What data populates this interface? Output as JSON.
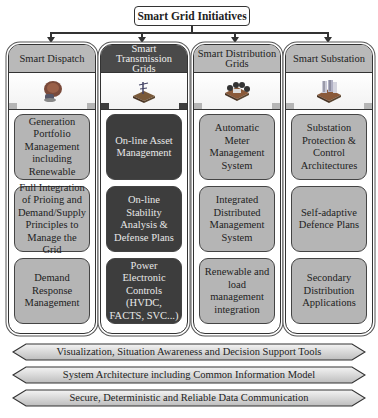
{
  "title": "Smart Grid Initiatives",
  "colors": {
    "light_fill": "#b5b5b5",
    "dark_fill": "#3d3d3d",
    "header_light": "#b9b9b9",
    "header_dark": "#4a4a4a",
    "stroke": "#333333"
  },
  "columns": [
    {
      "title": "Smart Dispatch",
      "icon": "generator-icon",
      "style": "light",
      "items": [
        "Generation Portfolio Management including Renewable",
        "Full Integration of Prioing and Demand/Supply Principles to Manage the Grid",
        "Demand Response Management"
      ]
    },
    {
      "title": "Smart Transmission Grids",
      "icon": "transmission-tower-icon",
      "style": "dark",
      "items": [
        "On-line Asset Management",
        "On-line Stability Analysis & Defense Plans",
        "Power Electronic Controls (HVDC, FACTS, SVC...)"
      ]
    },
    {
      "title": "Smart Distribution Grids",
      "icon": "distribution-network-icon",
      "style": "light",
      "items": [
        "Automatic Meter Management System",
        "Integrated Distributed Management System",
        "Renewable and load management integration"
      ]
    },
    {
      "title": "Smart Substation",
      "icon": "substation-icon",
      "style": "light",
      "items": [
        "Substation Protection & Control Architectures",
        "Self-adaptive Defence Plans",
        "Secondary Distribution Applications"
      ]
    }
  ],
  "bands": [
    "Visualization, Situation Awareness and Decision Support Tools",
    "System Architecture including Common Information Model",
    "Secure, Deterministic and Reliable Data Communication"
  ]
}
